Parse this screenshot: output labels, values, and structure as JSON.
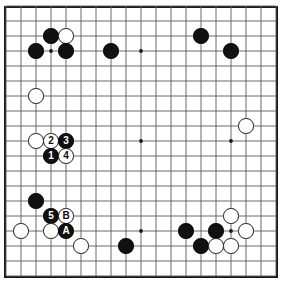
{
  "figure": {
    "kind": "go-board-diagram",
    "board_size": 19,
    "width_px": 283,
    "height_px": 286,
    "background_color": "#ffffff",
    "line_color": "#5a5a5a",
    "border_color": "#1a1a1a",
    "black_color": "#111111",
    "white_color": "#ffffff"
  },
  "grid": {
    "origin_x": 6,
    "origin_y": 6,
    "spacing": 15,
    "lines": 19,
    "hoshi": [
      {
        "col": 4,
        "row": 4
      },
      {
        "col": 10,
        "row": 4
      },
      {
        "col": 16,
        "row": 4
      },
      {
        "col": 4,
        "row": 10
      },
      {
        "col": 10,
        "row": 10
      },
      {
        "col": 16,
        "row": 10
      },
      {
        "col": 4,
        "row": 16
      },
      {
        "col": 10,
        "row": 16
      },
      {
        "col": 16,
        "row": 16
      }
    ]
  },
  "stones": [
    {
      "col": 4,
      "row": 3,
      "color": "black",
      "label": ""
    },
    {
      "col": 5,
      "row": 3,
      "color": "white",
      "label": ""
    },
    {
      "col": 3,
      "row": 4,
      "color": "black",
      "label": ""
    },
    {
      "col": 5,
      "row": 4,
      "color": "black",
      "label": ""
    },
    {
      "col": 8,
      "row": 4,
      "color": "black",
      "label": ""
    },
    {
      "col": 14,
      "row": 3,
      "color": "black",
      "label": ""
    },
    {
      "col": 16,
      "row": 4,
      "color": "black",
      "label": ""
    },
    {
      "col": 3,
      "row": 7,
      "color": "white",
      "label": ""
    },
    {
      "col": 17,
      "row": 9,
      "color": "white",
      "label": ""
    },
    {
      "col": 3,
      "row": 10,
      "color": "white",
      "label": ""
    },
    {
      "col": 4,
      "row": 10,
      "color": "white",
      "label": "2"
    },
    {
      "col": 5,
      "row": 10,
      "color": "black",
      "label": "3"
    },
    {
      "col": 4,
      "row": 11,
      "color": "black",
      "label": "1"
    },
    {
      "col": 5,
      "row": 11,
      "color": "white",
      "label": "4"
    },
    {
      "col": 3,
      "row": 14,
      "color": "black",
      "label": ""
    },
    {
      "col": 4,
      "row": 15,
      "color": "black",
      "label": "5"
    },
    {
      "col": 5,
      "row": 15,
      "color": "white",
      "label": "B"
    },
    {
      "col": 2,
      "row": 16,
      "color": "white",
      "label": ""
    },
    {
      "col": 4,
      "row": 16,
      "color": "white",
      "label": ""
    },
    {
      "col": 5,
      "row": 16,
      "color": "black",
      "label": "A"
    },
    {
      "col": 6,
      "row": 17,
      "color": "white",
      "label": ""
    },
    {
      "col": 9,
      "row": 17,
      "color": "black",
      "label": ""
    },
    {
      "col": 13,
      "row": 16,
      "color": "black",
      "label": ""
    },
    {
      "col": 15,
      "row": 16,
      "color": "black",
      "label": ""
    },
    {
      "col": 16,
      "row": 15,
      "color": "white",
      "label": ""
    },
    {
      "col": 17,
      "row": 16,
      "color": "white",
      "label": ""
    },
    {
      "col": 14,
      "row": 17,
      "color": "black",
      "label": ""
    },
    {
      "col": 15,
      "row": 17,
      "color": "white",
      "label": ""
    },
    {
      "col": 16,
      "row": 17,
      "color": "white",
      "label": ""
    }
  ],
  "move_sequence": {
    "numbered_moves": [
      "1",
      "2",
      "3",
      "4",
      "5"
    ],
    "letter_marks": [
      "A",
      "B"
    ]
  }
}
